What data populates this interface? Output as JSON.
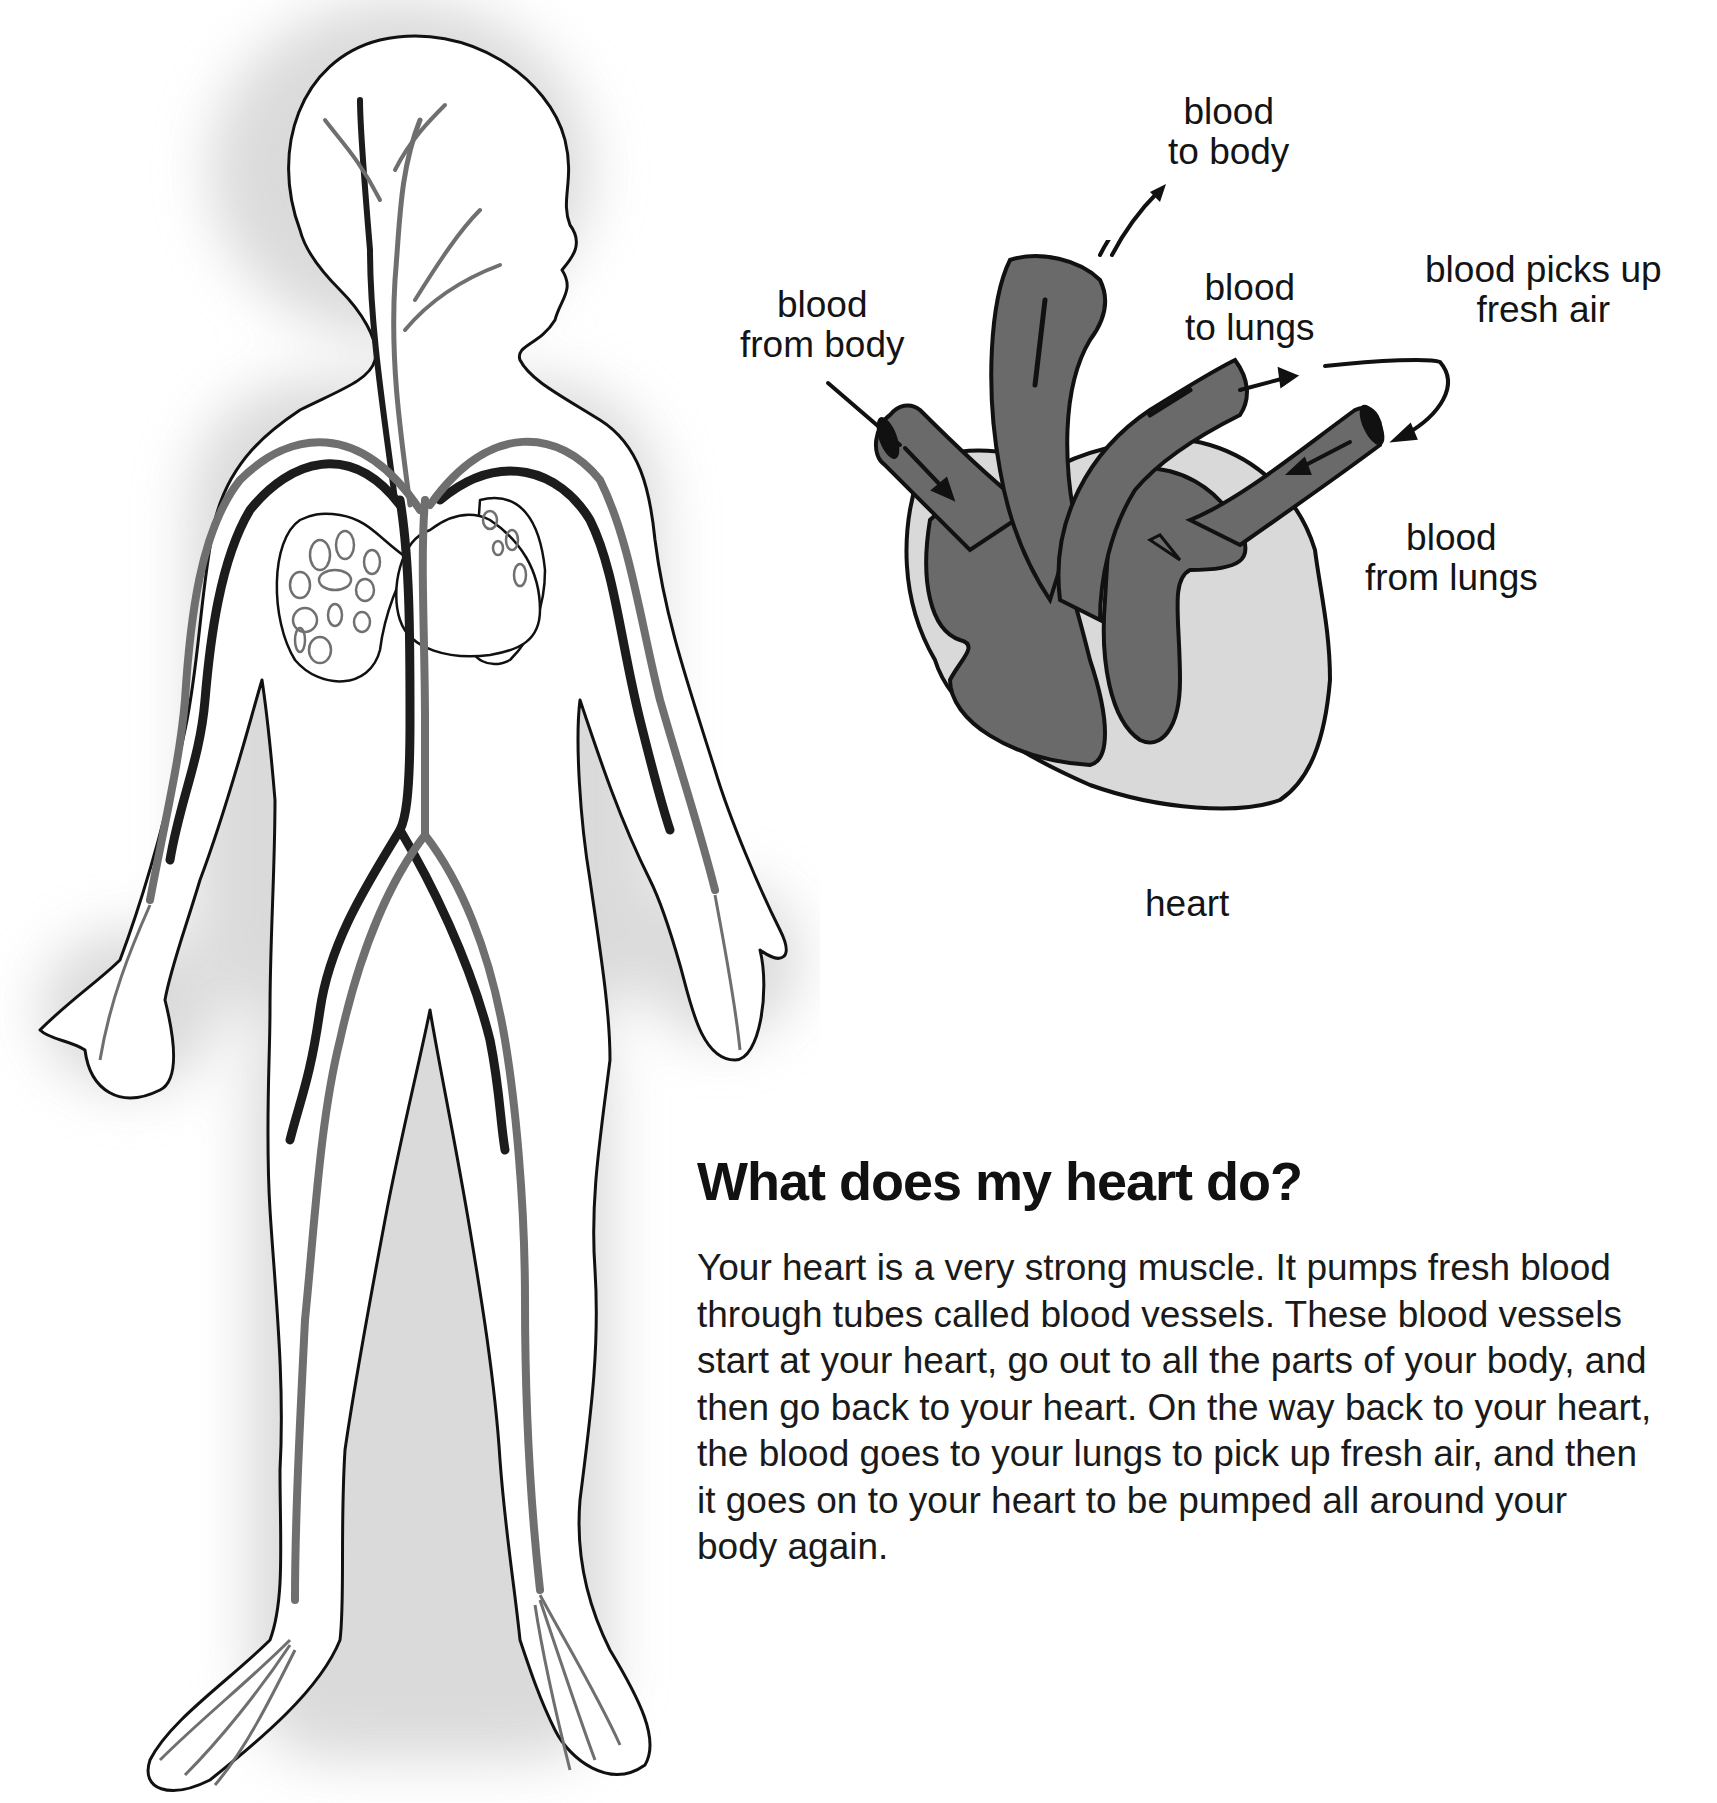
{
  "diagram": {
    "figure_body": {
      "description": "Child's body outline showing blood vessels (arteries and veins)"
    },
    "heart_labels": [
      {
        "id": "to_body",
        "line1": "blood",
        "line2": "to body"
      },
      {
        "id": "from_body",
        "line1": "blood",
        "line2": "from body"
      },
      {
        "id": "to_lungs",
        "line1": "blood",
        "line2": "to lungs"
      },
      {
        "id": "picks_up_air",
        "line1": "blood picks up",
        "line2": "fresh air"
      },
      {
        "id": "from_lungs",
        "line1": "blood",
        "line2": "from lungs"
      }
    ],
    "heart_caption": "heart"
  },
  "article": {
    "title": "What does my heart do?",
    "lines": [
      "Your heart is a very strong muscle. It pumps fresh blood",
      "through tubes called blood vessels. These blood vessels",
      "start at your heart, go out to all the parts of your body, and",
      "then go back to your heart. On the way back to your heart,",
      "the blood goes to your lungs to pick up fresh air, and then",
      "it goes on to your heart to be pumped all around your",
      "body again."
    ]
  },
  "colors": {
    "outline": "#111111",
    "artery_dark": "#1c1c1c",
    "vein_gray": "#6f6f6f",
    "heart_fill": "#6a6a6a",
    "heart_bg": "#d9d9d9",
    "shadow": "#e6e6e6"
  }
}
